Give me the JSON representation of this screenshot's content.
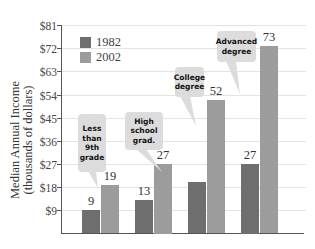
{
  "chart_data": {
    "type": "bar",
    "title": "",
    "xlabel": "",
    "ylabel": "Median Annual Income\n(thousands of dollars)",
    "ylabel_lines": [
      "Median Annual Income",
      "(thousands of dollars)"
    ],
    "ylim": [
      0,
      81
    ],
    "yticks": [
      9,
      18,
      27,
      36,
      45,
      54,
      63,
      72,
      81
    ],
    "ytick_labels": [
      "$9",
      "$18",
      "$27",
      "$36",
      "$45",
      "$54",
      "$63",
      "$72",
      "$81"
    ],
    "grid": true,
    "legend_position": "upper left",
    "categories": [
      "Less than 9th grade",
      "High school grad.",
      "College degree",
      "Advanced degree"
    ],
    "category_callouts": [
      "Less\nthan\n9th\ngrade",
      "High\nschool\ngrad.",
      "College\ndegree",
      "Advanced\ndegree"
    ],
    "series": [
      {
        "name": "1982",
        "color": "#6e6e6e",
        "values": [
          9,
          13,
          20,
          27
        ],
        "labels": [
          "9",
          "13",
          "",
          "27"
        ]
      },
      {
        "name": "2002",
        "color": "#9c9c9c",
        "values": [
          19,
          27,
          52,
          73
        ],
        "labels": [
          "19",
          "27",
          "52",
          "73"
        ]
      }
    ]
  },
  "colors": {
    "callout_bg": "#dcdcdc",
    "gridline": "#e3e3e3",
    "axis": "#555555"
  }
}
